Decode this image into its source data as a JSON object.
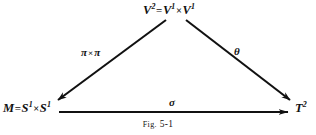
{
  "figure": {
    "caption_prefix": "Fig.",
    "caption_number": "5-1",
    "caption_full": "Fig. 5-1"
  },
  "diagram": {
    "type": "commutative-triangle",
    "ink_color": "#111111",
    "background_color": "#ffffff",
    "nodes": [
      {
        "id": "top",
        "position": "apex",
        "base": "V",
        "exponent": "2",
        "relation": "=",
        "product_left_base": "V",
        "product_left_exponent": "1",
        "product_operator": "×",
        "product_right_base": "V",
        "product_right_exponent": "1",
        "plain": "V² = V¹ × V¹"
      },
      {
        "id": "left",
        "position": "bottom-left",
        "base": "M",
        "relation": "=",
        "product_left_base": "S",
        "product_left_exponent": "1",
        "product_operator": "×",
        "product_right_base": "S",
        "product_right_exponent": "1",
        "plain": "M = S¹ × S¹"
      },
      {
        "id": "right",
        "position": "bottom-right",
        "base": "T",
        "exponent": "2",
        "plain": "T²"
      }
    ],
    "edges": [
      {
        "id": "pi-cross-pi",
        "from": "top",
        "to": "left",
        "label_left": "π",
        "label_operator": "×",
        "label_right": "π",
        "label_plain": "π × π",
        "direction": "down-left"
      },
      {
        "id": "theta",
        "from": "top",
        "to": "right",
        "label_plain": "θ",
        "direction": "down-right"
      },
      {
        "id": "sigma",
        "from": "left",
        "to": "right",
        "label_plain": "σ",
        "direction": "right"
      }
    ]
  }
}
